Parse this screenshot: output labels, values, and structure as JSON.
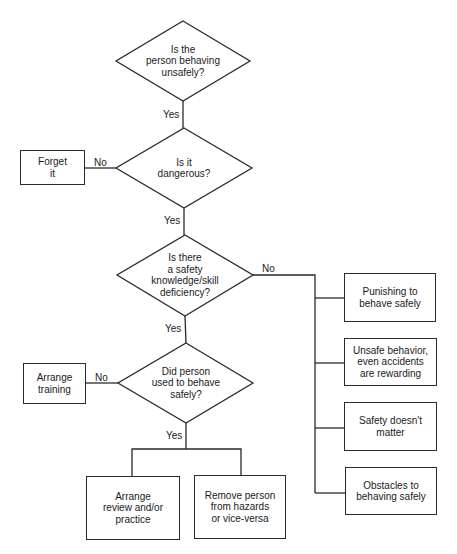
{
  "diagram": {
    "type": "flowchart",
    "decisions": [
      {
        "id": "d1",
        "text": "Is the\nperson behaving\nunsafely?"
      },
      {
        "id": "d2",
        "text": "Is it\ndangerous?"
      },
      {
        "id": "d3",
        "text": "Is there\na safety\nknowledge/skill\ndeficiency?"
      },
      {
        "id": "d4",
        "text": "Did person\nused to behave\nsafely?"
      }
    ],
    "boxes": {
      "forget_it": "Forget\nit",
      "arrange_training": "Arrange\ntraining",
      "arrange_review": "Arrange\nreview and/or\npractice",
      "remove_person": "Remove person\nfrom hazards\nor vice-versa",
      "punishing": "Punishing to\nbehave safely",
      "unsafe_rewarding": "Unsafe behavior,\neven accidents\nare rewarding",
      "safety_doesnt_matter": "Safety doesn't\nmatter",
      "obstacles": "Obstacles to\nbehaving safely"
    },
    "edge_labels": {
      "yes1": "Yes",
      "yes2": "Yes",
      "yes3": "Yes",
      "yes4": "Yes",
      "no_d2": "No",
      "no_d3": "No",
      "no_d4": "No"
    },
    "colors": {
      "line": "#2a2a2a",
      "background": "#ffffff",
      "text": "#1a1a1a"
    }
  }
}
